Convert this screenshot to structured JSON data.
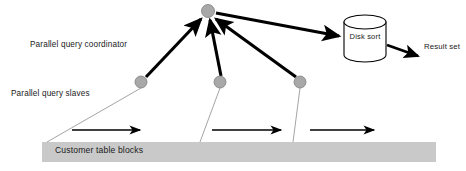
{
  "diagram": {
    "labels": {
      "coordinator": "Parallel query coordinator",
      "slaves": "Parallel query slaves",
      "table_bar": "Customer table blocks",
      "disk_sort": "Disk sort",
      "result_set": "Result set"
    },
    "colors": {
      "node_fill": "#a8a8a8",
      "node_stroke": "#7d7d7d",
      "bar_fill": "#c9c9c9",
      "arrow": "#000000",
      "thin_line": "#9a9a9a",
      "text": "#1a1a1a",
      "cylinder_fill": "#ffffff",
      "cylinder_stroke": "#000000",
      "background": "#ffffff"
    },
    "nodes": {
      "coordinator": {
        "cx": 208,
        "cy": 11,
        "r": 6.5
      },
      "slaves": [
        {
          "cx": 141,
          "cy": 82,
          "r": 6
        },
        {
          "cx": 220,
          "cy": 82,
          "r": 6
        },
        {
          "cx": 300,
          "cy": 82,
          "r": 6
        }
      ]
    },
    "cylinder": {
      "x": 344,
      "y": 15,
      "width": 42,
      "height": 47,
      "ellipse_ry": 7
    },
    "table_bar": {
      "x": 42,
      "y": 142,
      "width": 394,
      "height": 20
    },
    "scan_arrows": [
      {
        "x1": 72,
        "y1": 130,
        "x2": 142,
        "y2": 130
      },
      {
        "x1": 212,
        "y1": 130,
        "x2": 283,
        "y2": 130
      },
      {
        "x1": 310,
        "y1": 130,
        "x2": 376,
        "y2": 130
      }
    ],
    "thin_lines": [
      {
        "x1": 141,
        "y1": 88,
        "x2": 47,
        "y2": 142
      },
      {
        "x1": 220,
        "y1": 88,
        "x2": 200,
        "y2": 142
      },
      {
        "x1": 300,
        "y1": 88,
        "x2": 293,
        "y2": 142
      }
    ],
    "slave_to_coordinator_arrows": [
      {
        "x1": 146,
        "y1": 77,
        "x2": 202,
        "y2": 18
      },
      {
        "x1": 220,
        "y1": 76,
        "x2": 210,
        "y2": 19
      },
      {
        "x1": 296,
        "y1": 77,
        "x2": 215,
        "y2": 18
      }
    ],
    "coordinator_to_disk_arrow": {
      "x1": 216,
      "y1": 13,
      "x2": 341,
      "y2": 36
    },
    "disk_to_result_arrow": {
      "x1": 386,
      "y1": 45,
      "x2": 420,
      "y2": 57
    }
  }
}
